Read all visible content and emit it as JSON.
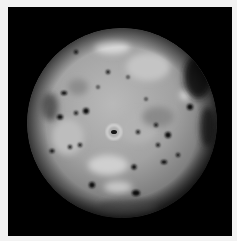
{
  "image": {
    "subject": "Grayscale photograph of a volcanic moon (Io) against black space",
    "background_color": "#000000",
    "border_color": "#f2f2f2"
  }
}
